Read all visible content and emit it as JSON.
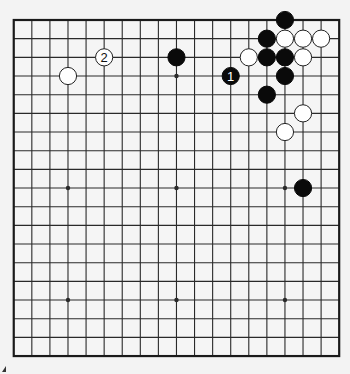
{
  "diagram": {
    "type": "go-board",
    "size": 19,
    "geometry": {
      "left": 13.75,
      "top": 20,
      "col_spacing": 18.08,
      "row_spacing": 18.67,
      "stone_radius": 8.6,
      "star_radius": 2.2
    },
    "colors": {
      "background": "#f3f3f3",
      "board": "#f5f5f5",
      "line": "#2a2a2a",
      "border": "#1a1a1a",
      "black_stone": "#0a0a0a",
      "white_stone": "#ffffff",
      "white_outline": "#222222"
    },
    "star_points": [
      [
        3,
        3
      ],
      [
        9,
        3
      ],
      [
        15,
        3
      ],
      [
        3,
        9
      ],
      [
        9,
        9
      ],
      [
        15,
        9
      ],
      [
        3,
        15
      ],
      [
        9,
        15
      ],
      [
        15,
        15
      ]
    ],
    "stones": [
      {
        "color": "black",
        "col": 15,
        "row": 0,
        "label": ""
      },
      {
        "color": "black",
        "col": 14,
        "row": 1,
        "label": ""
      },
      {
        "color": "white",
        "col": 15,
        "row": 1,
        "label": ""
      },
      {
        "color": "white",
        "col": 16,
        "row": 1,
        "label": ""
      },
      {
        "color": "white",
        "col": 17,
        "row": 1,
        "label": ""
      },
      {
        "color": "white",
        "col": 13,
        "row": 2,
        "label": ""
      },
      {
        "color": "black",
        "col": 14,
        "row": 2,
        "label": ""
      },
      {
        "color": "black",
        "col": 15,
        "row": 2,
        "label": ""
      },
      {
        "color": "white",
        "col": 16,
        "row": 2,
        "label": ""
      },
      {
        "color": "black",
        "col": 15,
        "row": 3,
        "label": ""
      },
      {
        "color": "black",
        "col": 14,
        "row": 4,
        "label": ""
      },
      {
        "color": "white",
        "col": 16,
        "row": 5,
        "label": ""
      },
      {
        "color": "white",
        "col": 15,
        "row": 6,
        "label": ""
      },
      {
        "color": "black",
        "col": 16,
        "row": 9,
        "label": ""
      },
      {
        "color": "black",
        "col": 9,
        "row": 2,
        "label": ""
      },
      {
        "color": "white",
        "col": 3,
        "row": 3,
        "label": ""
      },
      {
        "color": "black",
        "col": 12,
        "row": 3,
        "label": "1"
      },
      {
        "color": "white",
        "col": 5,
        "row": 2,
        "label": "2"
      }
    ],
    "move_labels": {
      "move_1": "1",
      "move_2": "2"
    }
  }
}
